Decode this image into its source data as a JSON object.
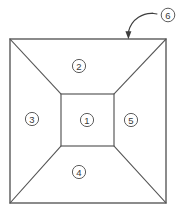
{
  "figure": {
    "background_color": "#ffffff",
    "line_color": "#4d4d4d",
    "label_color": "#3a3a3a",
    "outer_square": {
      "x": 10,
      "y": 39,
      "width": 156,
      "height": 164
    },
    "inner_square": {
      "x": 61,
      "y": 94,
      "width": 53,
      "height": 52
    },
    "faces": [
      {
        "id": "1",
        "label": "①",
        "name": "center-face",
        "cx": 87,
        "cy": 120,
        "region": "center"
      },
      {
        "id": "2",
        "label": "②",
        "name": "top-face",
        "cx": 79,
        "cy": 66,
        "region": "top"
      },
      {
        "id": "3",
        "label": "③",
        "name": "left-face",
        "cx": 32,
        "cy": 119,
        "region": "left"
      },
      {
        "id": "4",
        "label": "④",
        "name": "bottom-face",
        "cx": 79,
        "cy": 172,
        "region": "bottom"
      },
      {
        "id": "5",
        "label": "⑤",
        "name": "right-face",
        "cx": 131,
        "cy": 120,
        "region": "right"
      }
    ],
    "callout": {
      "id": "6",
      "label": "⑥",
      "name": "outer-edge-callout",
      "cx": 168,
      "cy": 15,
      "leader": {
        "from_x": 156,
        "from_y": 15,
        "arrow_tip_x": 128,
        "arrow_tip_y": 39,
        "curve": "M 156 14 C 146 13, 132 19, 128 33"
      }
    },
    "diagonals": [
      {
        "name": "diagonal-top-left",
        "x1": 10,
        "y1": 39,
        "x2": 61,
        "y2": 94
      },
      {
        "name": "diagonal-top-right",
        "x1": 166,
        "y1": 39,
        "x2": 114,
        "y2": 94
      },
      {
        "name": "diagonal-bottom-left",
        "x1": 10,
        "y1": 203,
        "x2": 61,
        "y2": 146
      },
      {
        "name": "diagonal-bottom-right",
        "x1": 166,
        "y1": 203,
        "x2": 114,
        "y2": 146
      }
    ]
  }
}
